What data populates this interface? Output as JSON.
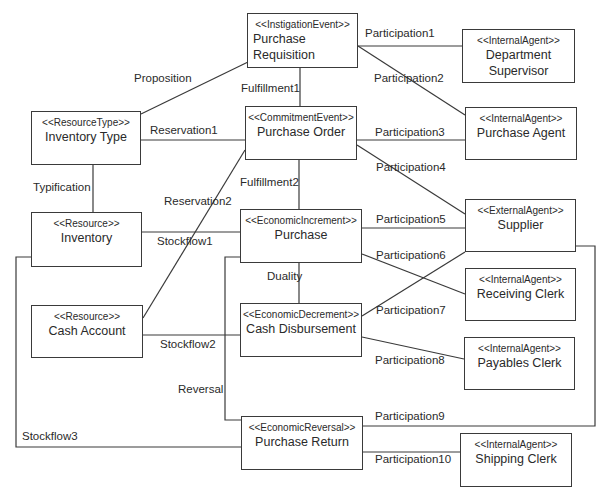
{
  "diagram": {
    "type": "REA model class diagram",
    "nodes": [
      {
        "id": "purchase-requisition",
        "stereotype": "<<InstigationEvent>>",
        "name_line1": "Purchase",
        "name_line2": "Requisition"
      },
      {
        "id": "department-supervisor",
        "stereotype": "<<InternalAgent>>",
        "name_line1": "Department",
        "name_line2": "Supervisor"
      },
      {
        "id": "inventory-type",
        "stereotype": "<<ResourceType>>",
        "name_line1": "Inventory Type",
        "name_line2": ""
      },
      {
        "id": "purchase-order",
        "stereotype": "<<CommitmentEvent>>",
        "name_line1": "Purchase Order",
        "name_line2": ""
      },
      {
        "id": "purchase-agent",
        "stereotype": "<<InternalAgent>>",
        "name_line1": "Purchase Agent",
        "name_line2": ""
      },
      {
        "id": "inventory",
        "stereotype": "<<Resource>>",
        "name_line1": "Inventory",
        "name_line2": ""
      },
      {
        "id": "purchase",
        "stereotype": "<<EconomicIncrement>>",
        "name_line1": "Purchase",
        "name_line2": ""
      },
      {
        "id": "supplier",
        "stereotype": "<<ExternalAgent>>",
        "name_line1": "Supplier",
        "name_line2": ""
      },
      {
        "id": "receiving-clerk",
        "stereotype": "<<InternalAgent>>",
        "name_line1": "Receiving Clerk",
        "name_line2": ""
      },
      {
        "id": "cash-account",
        "stereotype": "<<Resource>>",
        "name_line1": "Cash Account",
        "name_line2": ""
      },
      {
        "id": "cash-disbursement",
        "stereotype": "<<EconomicDecrement>>",
        "name_line1": "Cash Disbursement",
        "name_line2": ""
      },
      {
        "id": "payables-clerk",
        "stereotype": "<<InternalAgent>>",
        "name_line1": "Payables Clerk",
        "name_line2": ""
      },
      {
        "id": "purchase-return",
        "stereotype": "<<EconomicReversal>>",
        "name_line1": "Purchase Return",
        "name_line2": ""
      },
      {
        "id": "shipping-clerk",
        "stereotype": "<<InternalAgent>>",
        "name_line1": "Shipping Clerk",
        "name_line2": ""
      }
    ],
    "relationships": [
      {
        "label": "Proposition",
        "from": "inventory-type",
        "to": "purchase-requisition"
      },
      {
        "label": "Fulfillment1",
        "from": "purchase-requisition",
        "to": "purchase-order"
      },
      {
        "label": "Participation1",
        "from": "purchase-requisition",
        "to": "department-supervisor"
      },
      {
        "label": "Participation2",
        "from": "purchase-requisition",
        "to": "purchase-agent"
      },
      {
        "label": "Reservation1",
        "from": "inventory-type",
        "to": "purchase-order"
      },
      {
        "label": "Participation3",
        "from": "purchase-order",
        "to": "purchase-agent"
      },
      {
        "label": "Participation4",
        "from": "purchase-order",
        "to": "supplier"
      },
      {
        "label": "Typification",
        "from": "inventory-type",
        "to": "inventory"
      },
      {
        "label": "Reservation2",
        "from": "cash-account",
        "to": "purchase-order"
      },
      {
        "label": "Fulfillment2",
        "from": "purchase-order",
        "to": "purchase"
      },
      {
        "label": "Stockflow1",
        "from": "inventory",
        "to": "purchase"
      },
      {
        "label": "Participation5",
        "from": "purchase",
        "to": "supplier"
      },
      {
        "label": "Participation6",
        "from": "purchase",
        "to": "receiving-clerk"
      },
      {
        "label": "Duality",
        "from": "purchase",
        "to": "cash-disbursement"
      },
      {
        "label": "Participation7",
        "from": "cash-disbursement",
        "to": "supplier"
      },
      {
        "label": "Stockflow2",
        "from": "cash-account",
        "to": "cash-disbursement"
      },
      {
        "label": "Participation8",
        "from": "cash-disbursement",
        "to": "payables-clerk"
      },
      {
        "label": "Reversal",
        "from": "purchase",
        "to": "purchase-return"
      },
      {
        "label": "Participation9",
        "from": "purchase-return",
        "to": "supplier"
      },
      {
        "label": "Stockflow3",
        "from": "inventory",
        "to": "purchase-return"
      },
      {
        "label": "Participation10",
        "from": "purchase-return",
        "to": "shipping-clerk"
      }
    ]
  },
  "colors": {
    "line": "#3a3a3a",
    "text": "#2a2a2a",
    "background": "#ffffff"
  }
}
